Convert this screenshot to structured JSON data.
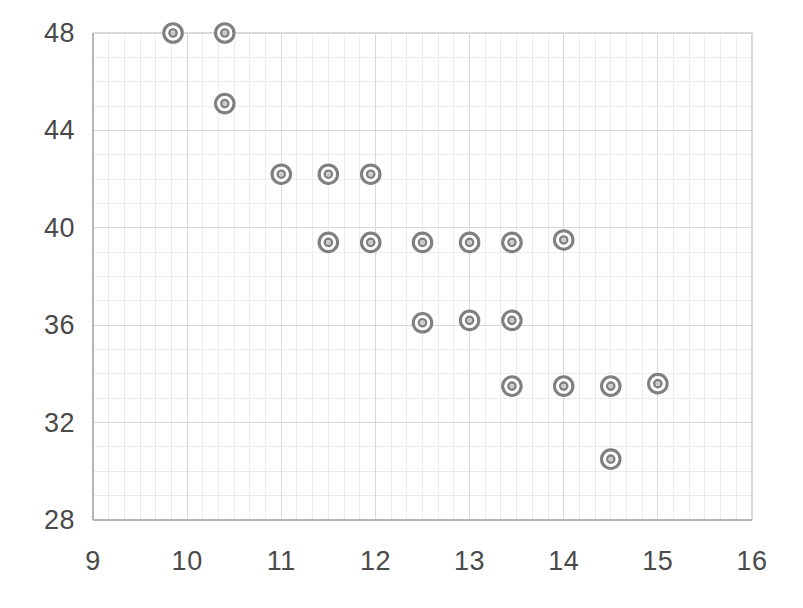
{
  "chart_data": {
    "type": "scatter",
    "title": "",
    "subtitle": "",
    "xlabel": "",
    "ylabel": "",
    "xlim": [
      9,
      16
    ],
    "ylim": [
      28,
      48
    ],
    "xticks": [
      9,
      10,
      11,
      12,
      13,
      14,
      15,
      16
    ],
    "yticks": [
      28,
      32,
      36,
      40,
      44,
      48
    ],
    "xtick_labels": [
      "9",
      "10",
      "11",
      "12",
      "13",
      "14",
      "15",
      "16"
    ],
    "ytick_labels": [
      "28",
      "32",
      "36",
      "40",
      "44",
      "48"
    ],
    "grid": true,
    "grid_major_x_step": 1,
    "grid_minor_x_step": 0.1667,
    "grid_major_y_step": 4,
    "grid_minor_y_step": 1,
    "legend": null,
    "legend_position": "none",
    "marker": "circle-ring",
    "marker_color": "#808080",
    "grid_color": "#d9d9d9",
    "grid_minor_color": "#ececec",
    "axis_color": "#bfbfbf",
    "tick_label_color": "#4a4a4a",
    "background_color": "#ffffff",
    "series": [
      {
        "name": "data",
        "points": [
          {
            "x": 9.85,
            "y": 48.0
          },
          {
            "x": 10.4,
            "y": 48.0
          },
          {
            "x": 10.4,
            "y": 45.1
          },
          {
            "x": 11.0,
            "y": 42.2
          },
          {
            "x": 11.5,
            "y": 42.2
          },
          {
            "x": 11.95,
            "y": 42.2
          },
          {
            "x": 11.5,
            "y": 39.4
          },
          {
            "x": 11.95,
            "y": 39.4
          },
          {
            "x": 12.5,
            "y": 39.4
          },
          {
            "x": 13.0,
            "y": 39.4
          },
          {
            "x": 13.45,
            "y": 39.4
          },
          {
            "x": 14.0,
            "y": 39.5
          },
          {
            "x": 12.5,
            "y": 36.1
          },
          {
            "x": 13.0,
            "y": 36.2
          },
          {
            "x": 13.45,
            "y": 36.2
          },
          {
            "x": 13.45,
            "y": 33.5
          },
          {
            "x": 14.0,
            "y": 33.5
          },
          {
            "x": 14.5,
            "y": 33.5
          },
          {
            "x": 15.0,
            "y": 33.6
          },
          {
            "x": 14.5,
            "y": 30.5
          }
        ]
      }
    ]
  },
  "geometry": {
    "plot_left": 93,
    "plot_right": 752,
    "plot_top": 33,
    "plot_bottom": 520,
    "ytick_label_x": 75,
    "xtick_label_y": 548
  }
}
